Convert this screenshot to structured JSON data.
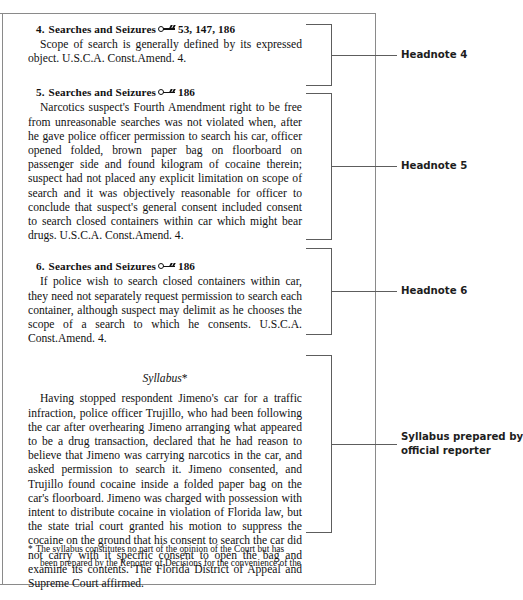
{
  "page": {
    "key_symbol_name": "west-key-number-icon"
  },
  "headnotes": [
    {
      "number": "4.",
      "topic": "Searches and Seizures",
      "key_numbers": "53, 147, 186",
      "body": "Scope of search is generally defined by its expressed object. U.S.C.A. Const.Amend. 4."
    },
    {
      "number": "5.",
      "topic": "Searches and Seizures",
      "key_numbers": "186",
      "body": "Narcotics suspect's Fourth Amendment right to be free from unreasonable searches was not violated when, after he gave police officer permission to search his car, officer opened folded, brown paper bag on floorboard on passenger side and found kilogram of cocaine therein; suspect had not placed any explicit limitation on scope of search and it was objectively reasonable for officer to conclude that suspect's general consent included consent to search closed containers within car which might bear drugs. U.S.C.A. Const.Amend. 4."
    },
    {
      "number": "6.",
      "topic": "Searches and Seizures",
      "key_numbers": "186",
      "body": "If police wish to search closed containers within car, they need not separately request permission to search each container, although suspect may delimit as he chooses the scope of a search to which he consents. U.S.C.A. Const.Amend. 4."
    }
  ],
  "syllabus": {
    "heading": "Syllabus",
    "heading_mark": "*",
    "body": "Having stopped respondent Jimeno's car for a traffic infraction, police officer Trujillo, who had been following the car after overhearing Jimeno arranging what appeared to be a drug transaction, declared that he had reason to believe that Jimeno was carrying narcotics in the car, and asked permission to search it. Jimeno consented, and Trujillo found cocaine inside a folded paper bag on the car's floorboard. Jimeno was charged with possession with intent to distribute cocaine in violation of Florida law, but the state trial court granted his motion to suppress the cocaine on the ground that his consent to search the car did not carry with it specific consent to open the bag and examine its contents. The Florida District of Appeal and Supreme Court affirmed."
  },
  "footnote": {
    "mark": "*",
    "line1": "The syllabus constitutes no part of the opinion of the Court but has",
    "line2": "been prepared by the Reporter of Decisions for the convenience of the"
  },
  "callouts": [
    {
      "label": "Headnote 4"
    },
    {
      "label": "Headnote 5"
    },
    {
      "label": "Headnote 6"
    },
    {
      "label_line1": "Syllabus prepared by",
      "label_line2": "official reporter"
    }
  ]
}
